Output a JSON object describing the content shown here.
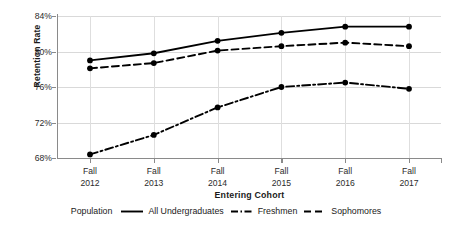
{
  "chart_data": {
    "type": "line",
    "title": "",
    "xlabel": "Entering Cohort",
    "ylabel": "Retention Rate",
    "categories": [
      "Fall 2012",
      "Fall 2013",
      "Fall 2014",
      "Fall 2015",
      "Fall 2016",
      "Fall 2017"
    ],
    "x_tick_lines": [
      {
        "line1": "Fall",
        "line2": "2012"
      },
      {
        "line1": "Fall",
        "line2": "2013"
      },
      {
        "line1": "Fall",
        "line2": "2014"
      },
      {
        "line1": "Fall",
        "line2": "2015"
      },
      {
        "line1": "Fall",
        "line2": "2016"
      },
      {
        "line1": "Fall",
        "line2": "2017"
      }
    ],
    "ylim": [
      68,
      84
    ],
    "y_ticks": [
      68,
      72,
      76,
      80,
      84
    ],
    "y_tick_labels": [
      "68%",
      "72%",
      "76%",
      "80%",
      "84%"
    ],
    "grid": true,
    "legend_position": "bottom",
    "legend_title": "Population",
    "series": [
      {
        "name": "All Undergraduates",
        "style": "solid",
        "color": "#000000",
        "values": [
          79.0,
          79.8,
          81.2,
          82.1,
          82.8,
          82.8
        ]
      },
      {
        "name": "Freshmen",
        "style": "dashdot",
        "color": "#000000",
        "values": [
          68.4,
          70.6,
          73.7,
          76.0,
          76.5,
          75.8
        ]
      },
      {
        "name": "Sophomores",
        "style": "dashed",
        "color": "#000000",
        "values": [
          78.1,
          78.7,
          80.1,
          80.6,
          81.0,
          80.6
        ]
      }
    ]
  },
  "axes": {
    "y_title": "Retention Rate",
    "x_title": "Entering Cohort"
  }
}
